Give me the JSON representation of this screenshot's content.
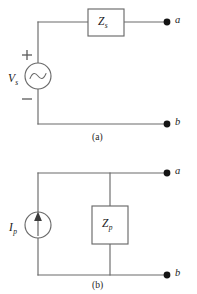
{
  "figure": {
    "panels": [
      {
        "id": "panel-a",
        "caption": "(a)",
        "type": "thevenin-voltage-source",
        "components": [
          {
            "name": "voltage-source",
            "symbol": "ac-sine",
            "label_main": "V",
            "label_sub": "s",
            "polarity_plus": "+",
            "polarity_minus": "−"
          },
          {
            "name": "series-impedance",
            "symbol": "rectangle-box",
            "label_main": "Z",
            "label_sub": "s"
          }
        ],
        "terminals": [
          {
            "name": "terminal-a",
            "label": "a"
          },
          {
            "name": "terminal-b",
            "label": "b"
          }
        ]
      },
      {
        "id": "panel-b",
        "caption": "(b)",
        "type": "norton-current-source",
        "components": [
          {
            "name": "current-source",
            "symbol": "arrow-up",
            "label_main": "I",
            "label_sub": "p"
          },
          {
            "name": "parallel-impedance",
            "symbol": "rectangle-box",
            "label_main": "Z",
            "label_sub": "p"
          }
        ],
        "terminals": [
          {
            "name": "terminal-a",
            "label": "a"
          },
          {
            "name": "terminal-b",
            "label": "b"
          }
        ]
      }
    ]
  },
  "colors": {
    "background": "#ffffff",
    "wire": "#6a6a6a",
    "text": "#1a1a1a",
    "terminal_dot": "#141414"
  }
}
